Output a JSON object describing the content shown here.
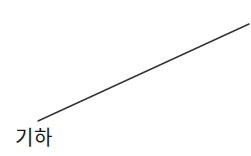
{
  "diagram": {
    "label": "기하",
    "line": {
      "x1": 38,
      "y1": 121,
      "x2": 249,
      "y2": 24,
      "color": "#333333",
      "width": 1.4
    }
  }
}
